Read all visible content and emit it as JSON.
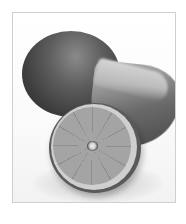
{
  "image": {
    "subject": "Black-and-white photograph of limes: one whole lime in back, one wedge on the right, and one cut half in front showing segments",
    "palette": {
      "background": "#ffffff",
      "frame_border": "#cfcfcf",
      "dark_rind": "#3d3d3d",
      "cut_flesh": "#9c9c9c",
      "pith_ring": "#cfcfcf"
    }
  }
}
